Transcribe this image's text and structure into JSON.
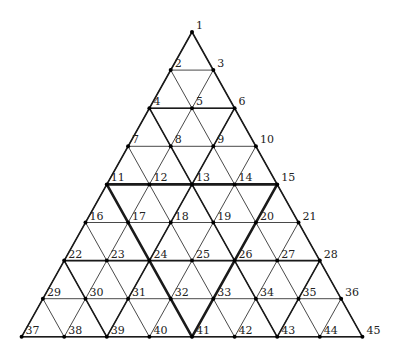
{
  "diagram": {
    "type": "triangular-grid",
    "rows": 9,
    "origin": {
      "x": 192,
      "y": 32
    },
    "dx": 42.6,
    "dy": 38.1,
    "colors": {
      "line": "#1a1a1a",
      "node": "#000000",
      "label": "#222222"
    },
    "stroke_widths": {
      "thin": 0.8,
      "medium": 1.6,
      "thick": 2.6
    },
    "node_labels": [
      "1",
      "2",
      "3",
      "4",
      "5",
      "6",
      "7",
      "8",
      "9",
      "10",
      "11",
      "12",
      "13",
      "14",
      "15",
      "16",
      "17",
      "18",
      "19",
      "20",
      "21",
      "22",
      "23",
      "24",
      "25",
      "26",
      "27",
      "28",
      "29",
      "30",
      "31",
      "32",
      "33",
      "34",
      "35",
      "36",
      "37",
      "38",
      "39",
      "40",
      "41",
      "42",
      "43",
      "44",
      "45"
    ],
    "medium_lines": [
      [
        1,
        37
      ],
      [
        1,
        45
      ],
      [
        37,
        45
      ],
      [
        4,
        6
      ],
      [
        22,
        28
      ],
      [
        4,
        13
      ],
      [
        6,
        13
      ],
      [
        13,
        24
      ],
      [
        13,
        26
      ],
      [
        22,
        39
      ],
      [
        24,
        39
      ],
      [
        26,
        43
      ],
      [
        28,
        43
      ]
    ],
    "thick_lines": [
      [
        11,
        15
      ],
      [
        11,
        41
      ],
      [
        15,
        41
      ]
    ]
  }
}
